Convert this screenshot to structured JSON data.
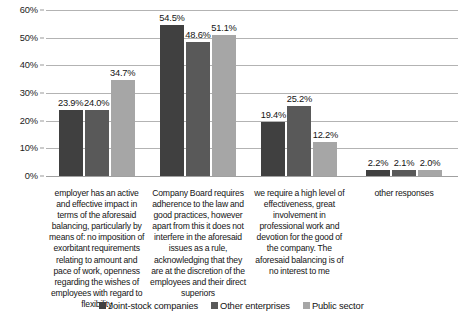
{
  "chart_data": {
    "type": "bar",
    "title": "",
    "subtitle": "",
    "xlabel": "",
    "ylabel": "",
    "ylim": [
      0,
      60
    ],
    "ytick_labels": [
      "0%",
      "10%",
      "20%",
      "30%",
      "40%",
      "50%",
      "60%"
    ],
    "ytick_values": [
      0,
      10,
      20,
      30,
      40,
      50,
      60
    ],
    "grid": true,
    "legend_position": "bottom",
    "value_suffix": "%",
    "categories": [
      "employer has an active and effective impact in terms of the aforesaid balancing, particularly by means of: no imposition of exorbitant requirements relating to amount and pace of work, openness regarding the wishes of employees with regard to flexibility",
      "Company Board requires adherence to the law and good practices, however apart from this it does not interfere in the aforesaid issues as a rule, acknowledging that they are at the discretion of the employees and their direct superiors",
      "we require a high level of effectiveness, great involvement in professional work and devotion for the good of the company. The aforesaid balancing is of no interest to me",
      "other responses"
    ],
    "series": [
      {
        "name": "Joint-stock companies",
        "color": "#404040",
        "values": [
          23.9,
          54.5,
          19.4,
          2.2
        ],
        "labels": [
          "23.9%",
          "54.5%",
          "19.4%",
          "2.2%"
        ]
      },
      {
        "name": "Other enterprises",
        "color": "#595959",
        "values": [
          24.0,
          48.6,
          25.2,
          2.1
        ],
        "labels": [
          "24.0%",
          "48.6%",
          "25.2%",
          "2.1%"
        ]
      },
      {
        "name": "Public sector",
        "color": "#a6a6a6",
        "values": [
          34.7,
          51.1,
          12.2,
          2.0
        ],
        "labels": [
          "34.7%",
          "51.1%",
          "12.2%",
          "2.0%"
        ]
      }
    ]
  }
}
